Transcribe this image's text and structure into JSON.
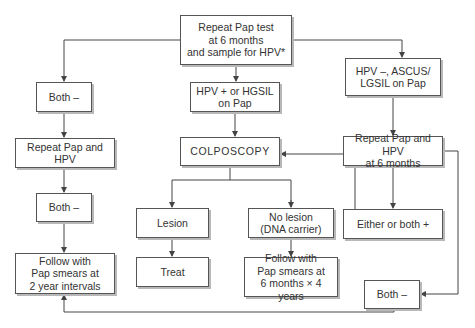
{
  "diagram": {
    "line_color": "#444444",
    "box_border_color": "#555555",
    "box_shadow_color": "#b8b8b8",
    "nodes": {
      "start": "Repeat Pap test\nat 6 months\nand sample for HPV*",
      "left_both_neg_1": "Both –",
      "left_repeat": "Repeat Pap and HPV",
      "left_both_neg_2": "Both –",
      "left_follow": "Follow with\nPap smears at\n2 year intervals",
      "center_hpv_pos": "HPV + or HGSIL\non Pap",
      "colposcopy": "COLPOSCOPY",
      "lesion": "Lesion",
      "treat": "Treat",
      "no_lesion": "No lesion\n(DNA carrier)",
      "follow_6m": "Follow with\nPap smears at\n6 months × 4 years",
      "right_hpv_neg": "HPV –, ASCUS/\nLGSIL on Pap",
      "right_repeat": "Repeat Pap and HPV\nat 6 months",
      "either_pos": "Either or both +",
      "right_both_neg": "Both –"
    }
  }
}
